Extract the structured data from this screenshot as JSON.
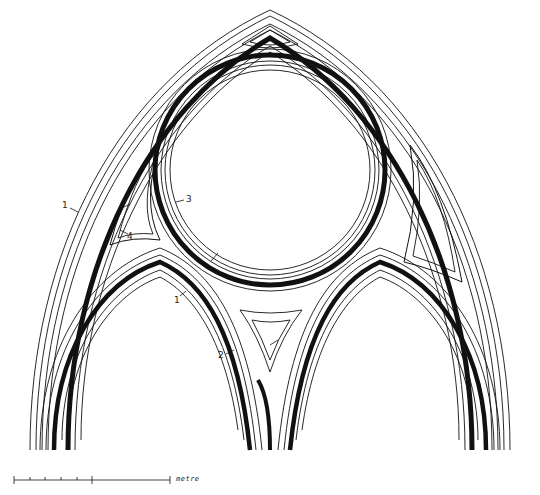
{
  "figure": {
    "labels": [
      {
        "id": "1a",
        "text": "1",
        "x": 68,
        "y": 202
      },
      {
        "id": "3",
        "text": "3",
        "x": 187,
        "y": 196
      },
      {
        "id": "4",
        "text": "4",
        "x": 127,
        "y": 237
      },
      {
        "id": "1b",
        "text": "1",
        "x": 174,
        "y": 298
      },
      {
        "id": "2",
        "text": "2",
        "x": 218,
        "y": 352
      }
    ],
    "scale_bar": {
      "unit_label": "metre",
      "x_start": 14,
      "x_end": 170,
      "y": 480,
      "ticks": [
        14,
        30,
        45,
        61,
        77,
        92,
        170
      ]
    },
    "colors": {
      "line": "#111111",
      "background": "#ffffff"
    }
  }
}
